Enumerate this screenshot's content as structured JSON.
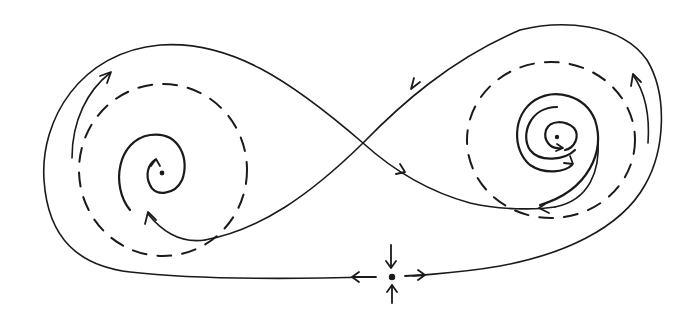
{
  "diagram": {
    "type": "phase-portrait",
    "description": "Hand-drawn phase portrait: figure-eight homoclinic-like orbit around two spiral fixed points, each enclosed by a dashed limit cycle, with a saddle point below the crossing",
    "colors": {
      "ink": "#1a1a1a",
      "background": "#ffffff"
    },
    "elements": {
      "left_fixed_point": {
        "label": "left spiral fixed point",
        "x": 162,
        "y": 173
      },
      "right_fixed_point": {
        "label": "right spiral fixed point",
        "x": 557,
        "y": 137
      },
      "saddle_point": {
        "label": "saddle point",
        "x": 392,
        "y": 277
      },
      "left_limit_cycle": {
        "label": "left dashed limit cycle (unstable)",
        "style": "dashed"
      },
      "right_limit_cycle": {
        "label": "right dashed limit cycle (unstable)",
        "style": "dashed"
      },
      "figure_eight_orbit": {
        "label": "outer trajectory forming figure-eight",
        "crossing": {
          "x": 363,
          "y": 143
        }
      }
    },
    "icons": {
      "saddle_in_arrows": "arrow-down / arrow-up",
      "saddle_out_arrows": "arrow-left / arrow-right"
    }
  }
}
